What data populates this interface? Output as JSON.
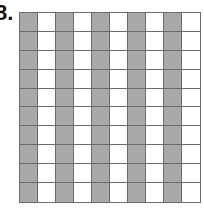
{
  "problem": {
    "label": "8."
  },
  "grid": {
    "rows": 10,
    "columns": 10,
    "shaded_columns": [
      0,
      2,
      4,
      6,
      8
    ],
    "shaded_count": 50,
    "total_count": 100,
    "colors": {
      "shaded": "#a9a9a9",
      "unshaded": "#ffffff",
      "lines": "#6a6a6a"
    }
  }
}
